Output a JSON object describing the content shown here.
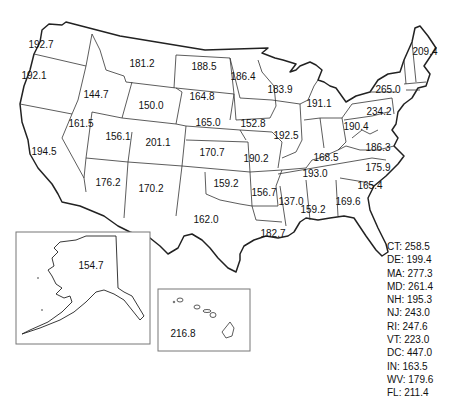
{
  "map": {
    "title_cropped": "",
    "states": [
      {
        "abbr": "WA",
        "value": "192.7",
        "x": 41,
        "y": 44
      },
      {
        "abbr": "OR",
        "value": "192.1",
        "x": 34,
        "y": 75
      },
      {
        "abbr": "CA",
        "value": "194.5",
        "x": 44,
        "y": 151
      },
      {
        "abbr": "ID",
        "value": "144.7",
        "x": 96,
        "y": 94
      },
      {
        "abbr": "NV",
        "value": "161.5",
        "x": 81,
        "y": 123
      },
      {
        "abbr": "MT",
        "value": "181.2",
        "x": 142,
        "y": 63
      },
      {
        "abbr": "WY",
        "value": "150.0",
        "x": 151,
        "y": 105
      },
      {
        "abbr": "UT",
        "value": "156.1",
        "x": 118,
        "y": 136
      },
      {
        "abbr": "CO",
        "value": "201.1",
        "x": 158,
        "y": 142
      },
      {
        "abbr": "AZ",
        "value": "176.2",
        "x": 108,
        "y": 182
      },
      {
        "abbr": "NM",
        "value": "170.2",
        "x": 151,
        "y": 188
      },
      {
        "abbr": "ND",
        "value": "188.5",
        "x": 204,
        "y": 66
      },
      {
        "abbr": "SD",
        "value": "164.8",
        "x": 202,
        "y": 96
      },
      {
        "abbr": "NE",
        "value": "165.0",
        "x": 208,
        "y": 122
      },
      {
        "abbr": "KS",
        "value": "170.7",
        "x": 212,
        "y": 152
      },
      {
        "abbr": "OK",
        "value": "159.2",
        "x": 226,
        "y": 183
      },
      {
        "abbr": "TX",
        "value": "162.0",
        "x": 206,
        "y": 219
      },
      {
        "abbr": "MN",
        "value": "186.4",
        "x": 243,
        "y": 76
      },
      {
        "abbr": "IA",
        "value": "152.8",
        "x": 253,
        "y": 123
      },
      {
        "abbr": "MO",
        "value": "190.2",
        "x": 256,
        "y": 158
      },
      {
        "abbr": "AR",
        "value": "156.7",
        "x": 264,
        "y": 192
      },
      {
        "abbr": "LA",
        "value": "182.7",
        "x": 273,
        "y": 233
      },
      {
        "abbr": "WI",
        "value": "183.9",
        "x": 280,
        "y": 89
      },
      {
        "abbr": "IL",
        "value": "192.5",
        "x": 286,
        "y": 135
      },
      {
        "abbr": "MS",
        "value": "137.0",
        "x": 291,
        "y": 201
      },
      {
        "abbr": "MI",
        "value": "191.1",
        "x": 319,
        "y": 103
      },
      {
        "abbr": "KY",
        "value": "168.5",
        "x": 326,
        "y": 157
      },
      {
        "abbr": "TN",
        "value": "193.0",
        "x": 315,
        "y": 173
      },
      {
        "abbr": "AL",
        "value": "159.2",
        "x": 313,
        "y": 209
      },
      {
        "abbr": "OH",
        "value": "190.4",
        "x": 356,
        "y": 126
      },
      {
        "abbr": "GA",
        "value": "169.6",
        "x": 348,
        "y": 201
      },
      {
        "abbr": "PA",
        "value": "234.2",
        "x": 379,
        "y": 111
      },
      {
        "abbr": "NY",
        "value": "265.0",
        "x": 388,
        "y": 89
      },
      {
        "abbr": "ME",
        "value": "209.4",
        "x": 425,
        "y": 51
      },
      {
        "abbr": "VA",
        "value": "186.3",
        "x": 378,
        "y": 147
      },
      {
        "abbr": "NC",
        "value": "175.9",
        "x": 378,
        "y": 167
      },
      {
        "abbr": "SC",
        "value": "165.4",
        "x": 370,
        "y": 185
      },
      {
        "abbr": "AK",
        "value": "154.7",
        "x": 91,
        "y": 265
      },
      {
        "abbr": "HI",
        "value": "216.8",
        "x": 183,
        "y": 333
      }
    ],
    "side_list": [
      "CT: 258.5",
      "DE: 199.4",
      "MA: 277.3",
      "MD: 261.4",
      "NH: 195.3",
      "NJ: 243.0",
      "RI: 247.6",
      "VT: 223.0",
      "DC: 447.0",
      "IN: 163.5",
      "WV: 179.6",
      "FL: 211.4"
    ]
  }
}
